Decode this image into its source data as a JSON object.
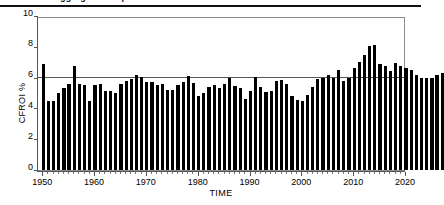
{
  "figure": {
    "top_rule": true,
    "clipped_caption": "ggregate          o  m paniesaa"
  },
  "chart_data": {
    "type": "bar",
    "title": "",
    "xlabel": "TIME",
    "ylabel": "CFROI %",
    "ylim": [
      0,
      10
    ],
    "xlim": [
      1949,
      2020
    ],
    "ytick_labels": [
      "0",
      "2",
      "4",
      "6",
      "8",
      "10"
    ],
    "ytick_values": [
      0,
      2,
      4,
      6,
      8,
      10
    ],
    "xtick_labels": [
      "1950",
      "1960",
      "1970",
      "1980",
      "1990",
      "2000",
      "2010",
      "2020"
    ],
    "xtick_values": [
      1950,
      1960,
      1970,
      1980,
      1990,
      2000,
      2010,
      2020
    ],
    "grid": false,
    "legend": "none",
    "bar_color": "#000000",
    "reference_line": {
      "value": 6,
      "color": "#555555",
      "label": ""
    },
    "categories": [
      1950,
      1951,
      1952,
      1953,
      1954,
      1955,
      1956,
      1957,
      1958,
      1959,
      1960,
      1961,
      1962,
      1963,
      1964,
      1965,
      1966,
      1967,
      1968,
      1969,
      1970,
      1971,
      1972,
      1973,
      1974,
      1975,
      1976,
      1977,
      1978,
      1979,
      1980,
      1981,
      1982,
      1983,
      1984,
      1985,
      1986,
      1987,
      1988,
      1989,
      1990,
      1991,
      1992,
      1993,
      1994,
      1995,
      1996,
      1997,
      1998,
      1999,
      2000,
      2001,
      2002,
      2003,
      2004,
      2005,
      2006,
      2007,
      2008,
      2009,
      2010,
      2011,
      2012,
      2013,
      2014,
      2015,
      2016,
      2017,
      2018
    ],
    "values": [
      6.9,
      4.5,
      4.5,
      5.0,
      5.3,
      5.6,
      6.75,
      5.6,
      5.5,
      4.45,
      5.5,
      5.6,
      5.1,
      5.15,
      5.0,
      5.6,
      5.8,
      5.9,
      6.2,
      6.05,
      5.7,
      5.7,
      5.5,
      5.6,
      5.2,
      5.2,
      5.5,
      5.7,
      6.1,
      5.65,
      4.8,
      5.0,
      5.4,
      5.5,
      5.35,
      5.6,
      5.95,
      5.45,
      5.3,
      4.6,
      5.15,
      6.05,
      5.4,
      5.05,
      5.1,
      5.8,
      5.85,
      5.6,
      4.8,
      4.55,
      4.45,
      4.85,
      5.4,
      5.9,
      5.95,
      6.2,
      5.95,
      6.5,
      5.75,
      5.95,
      6.65,
      7.0,
      7.45,
      8.05,
      8.15,
      6.9,
      6.75,
      6.4,
      6.95
    ],
    "values_tail": [
      6.75,
      6.6,
      6.5,
      6.2,
      6.0,
      5.95,
      5.95,
      6.2,
      6.3
    ],
    "max_value": 8.15,
    "min_value": 4.45,
    "peak_year": 2006,
    "trough_year": 1994
  }
}
